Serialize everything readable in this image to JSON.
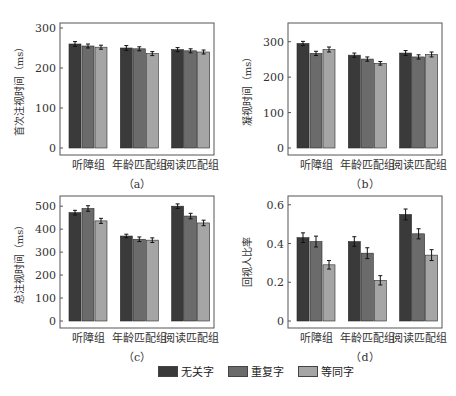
{
  "colors": {
    "series": [
      "#3a3a3a",
      "#6b6b6b",
      "#a5a5a5"
    ],
    "axis": "#555555"
  },
  "legend": {
    "items": [
      {
        "label": "无关字",
        "color": "#3a3a3a"
      },
      {
        "label": "重复字",
        "color": "#6b6b6b"
      },
      {
        "label": "等同字",
        "color": "#a5a5a5"
      }
    ]
  },
  "chart_data": [
    {
      "type": "bar",
      "panel_label": "（a）",
      "title": "",
      "xlabel": "",
      "ylabel": "首次注视时间（ms）",
      "ylim": [
        0,
        310
      ],
      "yticks": [
        0,
        100,
        200,
        300
      ],
      "grid": false,
      "legend_position": "bottom (shared)",
      "categories": [
        "听障组",
        "年龄匹配组",
        "阅读匹配组"
      ],
      "series": [
        {
          "name": "无关字",
          "values": [
            260,
            250,
            246
          ],
          "errors": [
            6,
            6,
            5
          ]
        },
        {
          "name": "重复字",
          "values": [
            255,
            248,
            243
          ],
          "errors": [
            5,
            5,
            5
          ]
        },
        {
          "name": "等同字",
          "values": [
            252,
            236,
            240
          ],
          "errors": [
            5,
            5,
            5
          ]
        }
      ]
    },
    {
      "type": "bar",
      "panel_label": "（b）",
      "title": "",
      "xlabel": "",
      "ylabel": "凝视时间（ms）",
      "ylim": [
        0,
        350
      ],
      "yticks": [
        0,
        100,
        200,
        300
      ],
      "grid": false,
      "legend_position": "bottom (shared)",
      "categories": [
        "听障组",
        "年龄匹配组",
        "阅读匹配组"
      ],
      "series": [
        {
          "name": "无关字",
          "values": [
            295,
            262,
            268
          ],
          "errors": [
            6,
            6,
            7
          ]
        },
        {
          "name": "重复字",
          "values": [
            267,
            251,
            257
          ],
          "errors": [
            6,
            6,
            6
          ]
        },
        {
          "name": "等同字",
          "values": [
            278,
            239,
            264
          ],
          "errors": [
            7,
            5,
            7
          ]
        }
      ]
    },
    {
      "type": "bar",
      "panel_label": "（c）",
      "title": "",
      "xlabel": "",
      "ylabel": "总注视时间（ms）",
      "ylim": [
        0,
        540
      ],
      "yticks": [
        0,
        100,
        200,
        300,
        400,
        500
      ],
      "grid": false,
      "legend_position": "bottom (shared)",
      "categories": [
        "听障组",
        "年龄匹配组",
        "阅读匹配组"
      ],
      "series": [
        {
          "name": "无关字",
          "values": [
            472,
            370,
            500
          ],
          "errors": [
            10,
            8,
            10
          ]
        },
        {
          "name": "重复字",
          "values": [
            490,
            356,
            457
          ],
          "errors": [
            12,
            10,
            12
          ]
        },
        {
          "name": "等同字",
          "values": [
            436,
            352,
            427
          ],
          "errors": [
            11,
            10,
            12
          ]
        }
      ]
    },
    {
      "type": "bar",
      "panel_label": "（d）",
      "title": "",
      "xlabel": "",
      "ylabel": "回视人比率",
      "ylim": [
        0,
        0.64
      ],
      "yticks": [
        0,
        0.2,
        0.4,
        0.6
      ],
      "ytick_labels": [
        "0",
        "0.2",
        "0.4",
        "0.6"
      ],
      "grid": false,
      "legend_position": "bottom (shared)",
      "categories": [
        "听障组",
        "年龄匹配组",
        "阅读匹配组"
      ],
      "series": [
        {
          "name": "无关字",
          "values": [
            0.43,
            0.41,
            0.55
          ],
          "errors": [
            0.025,
            0.025,
            0.028
          ]
        },
        {
          "name": "重复字",
          "values": [
            0.41,
            0.35,
            0.45
          ],
          "errors": [
            0.028,
            0.028,
            0.026
          ]
        },
        {
          "name": "等同字",
          "values": [
            0.29,
            0.21,
            0.34
          ],
          "errors": [
            0.022,
            0.024,
            0.028
          ]
        }
      ]
    }
  ]
}
